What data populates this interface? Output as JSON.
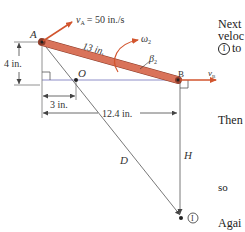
{
  "diagram": {
    "points": {
      "A": {
        "label": "A"
      },
      "B": {
        "label": "B"
      },
      "O": {
        "label": "O"
      },
      "I": {
        "label": "I"
      }
    },
    "velocities": {
      "vA": {
        "symbol": "v",
        "subscript": "A",
        "value_text": "= 50 in./s"
      },
      "vB": {
        "symbol": "v",
        "subscript": "B"
      }
    },
    "bar_length_label": "13 in.",
    "omega_label": "ω",
    "omega_subscript": "2",
    "beta_label": "β",
    "beta_subscript": "2",
    "dimensions": {
      "vertical": "4 in.",
      "short_horizontal": "3 in.",
      "long_horizontal": "12.4 in."
    },
    "distances": {
      "D": "D",
      "H": "H"
    },
    "colors": {
      "bar_fill": "#d9735a",
      "bar_stroke": "#8a3a28",
      "velocity_arrow": "#d2552e",
      "baseline": "#8e8ec8",
      "construction_line": "#555555",
      "text": "#333333"
    }
  },
  "side_text": {
    "line1": "Next",
    "line2": "veloc",
    "line3_circled": "I",
    "line3_rest": "to",
    "line4": "Then",
    "line5": "so",
    "line6": "Agai"
  }
}
